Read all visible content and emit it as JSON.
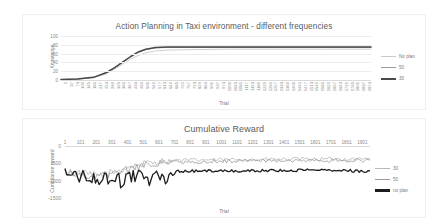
{
  "charts": [
    {
      "id": "knowledge",
      "title": "Action Planning in Taxi environment - different frequencies",
      "xlabel": "Trial",
      "ylabel": "Knowledge",
      "legend": [
        {
          "label": "No plan",
          "color": "#c9c9c9"
        },
        {
          "label": "50",
          "color": "#9a9a9a"
        },
        {
          "label": "30",
          "color": "#4a4a4a"
        }
      ],
      "yticks": [
        "0",
        "20",
        "40",
        "60",
        "80",
        "100"
      ],
      "xticks": [
        "1",
        "37",
        "73",
        "109",
        "145",
        "181",
        "217",
        "253",
        "289",
        "325",
        "361",
        "397",
        "433",
        "469",
        "505",
        "541",
        "577",
        "613",
        "649",
        "685",
        "721",
        "757",
        "793",
        "829",
        "865",
        "901",
        "937",
        "973",
        "1009",
        "1045",
        "1081",
        "1117",
        "1153",
        "1189",
        "1225",
        "1261",
        "1297",
        "1333",
        "1369",
        "1405",
        "1441",
        "1477",
        "1513",
        "1549",
        "1585",
        "1621",
        "1657",
        "1693",
        "1729",
        "1765",
        "1801",
        "1837",
        "1873"
      ]
    },
    {
      "id": "reward",
      "title": "Cumulative Reward",
      "xlabel": "Trial",
      "ylabel": "Cumulative reward",
      "legend": [
        {
          "label": "30",
          "color": "#b8b8b8"
        },
        {
          "label": "50",
          "color": "#9a9a9a"
        },
        {
          "label": "no plan",
          "color": "#1c1c1c"
        }
      ],
      "yticks": [
        "0",
        "-500",
        "-1000",
        "-1500"
      ],
      "xticks": [
        "1",
        "101",
        "201",
        "301",
        "401",
        "501",
        "601",
        "701",
        "801",
        "901",
        "1001",
        "1101",
        "1201",
        "1301",
        "1401",
        "1501",
        "1601",
        "1701",
        "1801",
        "1901"
      ]
    }
  ],
  "chart_data": [
    {
      "type": "line",
      "title": "Action Planning in Taxi environment - different frequencies",
      "xlabel": "Trial",
      "ylabel": "Knowledge",
      "xlim": [
        1,
        1900
      ],
      "ylim": [
        0,
        100
      ],
      "grid": true,
      "legend_position": "right",
      "x": [
        1,
        100,
        200,
        280,
        330,
        380,
        430,
        470,
        520,
        580,
        650,
        800,
        1000,
        1300,
        1600,
        1900
      ],
      "series": [
        {
          "name": "No plan",
          "color": "#c9c9c9",
          "values": [
            1,
            2,
            5,
            14,
            25,
            36,
            48,
            55,
            62,
            66,
            68,
            69,
            70,
            70,
            70,
            70
          ]
        },
        {
          "name": "50",
          "color": "#9a9a9a",
          "values": [
            1,
            2,
            6,
            17,
            28,
            40,
            53,
            62,
            69,
            73,
            74,
            74,
            74,
            74,
            74,
            74
          ]
        },
        {
          "name": "30",
          "color": "#4a4a4a",
          "values": [
            1,
            2,
            6,
            17,
            28,
            41,
            54,
            63,
            70,
            74,
            75,
            75,
            75,
            75,
            75,
            75
          ]
        }
      ]
    },
    {
      "type": "line",
      "title": "Cumulative Reward",
      "xlabel": "Trial",
      "ylabel": "Cumulative reward",
      "xlim": [
        1,
        1950
      ],
      "ylim": [
        -1500,
        0
      ],
      "grid": false,
      "legend_position": "right",
      "x": [
        1,
        100,
        200,
        300,
        400,
        500,
        600,
        700,
        800,
        900,
        1000,
        1100,
        1200,
        1300,
        1400,
        1500,
        1600,
        1700,
        1800,
        1900
      ],
      "series": [
        {
          "name": "30",
          "color": "#b8b8b8",
          "values": [
            -760,
            -800,
            -850,
            -780,
            -620,
            -520,
            -440,
            -420,
            -410,
            -400,
            -400,
            -395,
            -390,
            -390,
            -385,
            -385,
            -380,
            -380,
            -375,
            -375
          ]
        },
        {
          "name": "50",
          "color": "#9a9a9a",
          "values": [
            -770,
            -830,
            -880,
            -820,
            -680,
            -570,
            -480,
            -460,
            -450,
            -440,
            -440,
            -435,
            -430,
            -430,
            -425,
            -425,
            -420,
            -420,
            -415,
            -415
          ]
        },
        {
          "name": "no plan",
          "color": "#1c1c1c",
          "values": [
            -780,
            -870,
            -930,
            -960,
            -930,
            -760,
            -860,
            -730,
            -720,
            -720,
            -715,
            -715,
            -710,
            -710,
            -705,
            -700,
            -700,
            -695,
            -700,
            -740
          ]
        }
      ]
    }
  ]
}
